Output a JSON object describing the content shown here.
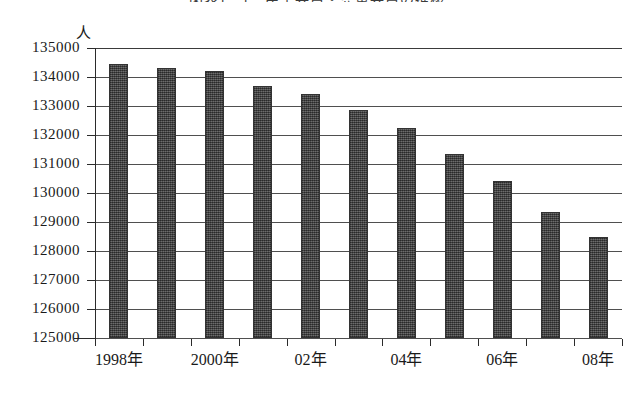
{
  "chart_data": {
    "type": "bar",
    "title": "図表1－1　民生委員・児童委員の推移",
    "xlabel": "",
    "ylabel": "",
    "y_unit_label": "人",
    "ylim": [
      125000,
      135000
    ],
    "ystep": 1000,
    "grid": true,
    "legend": "none",
    "categories": [
      "1998年",
      "1999年",
      "2000年",
      "01年",
      "02年",
      "03年",
      "04年",
      "05年",
      "06年",
      "07年",
      "08年"
    ],
    "tick_labels": [
      "1998年",
      "2000年",
      "02年",
      "04年",
      "06年",
      "08年"
    ],
    "tick_label_indices": [
      0,
      2,
      4,
      6,
      8,
      10
    ],
    "values": [
      134450,
      134300,
      134200,
      133700,
      133400,
      132870,
      132250,
      131350,
      130400,
      129350,
      128500
    ],
    "ytick_labels": [
      "135000",
      "134000",
      "133000",
      "132000",
      "131000",
      "130000",
      "129000",
      "128000",
      "127000",
      "126000",
      "125000"
    ],
    "ytick_values": [
      135000,
      134000,
      133000,
      132000,
      131000,
      130000,
      129000,
      128000,
      127000,
      126000,
      125000
    ],
    "series": [
      {
        "name": "人数",
        "color": "#4d4d4d",
        "values": [
          134450,
          134300,
          134200,
          133700,
          133400,
          132870,
          132250,
          131350,
          130400,
          129350,
          128500
        ]
      }
    ]
  }
}
